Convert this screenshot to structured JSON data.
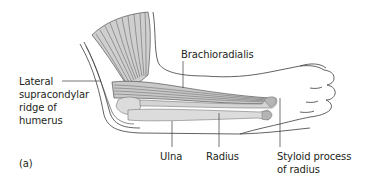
{
  "figure": {
    "panel_label": "(a)",
    "colors": {
      "outline": "#3a3a3a",
      "muscle_fill": "#c9c9c9",
      "muscle_fiber": "#555555",
      "bone_fill": "#dcdcdc",
      "bone_dark": "#b5b5b5",
      "leader_line": "#3a3a3a",
      "text": "#231f20",
      "background": "#ffffff"
    },
    "labels": {
      "lateral_supracondylar": "Lateral\nsupracondylar\nridge of\nhumerus",
      "brachioradialis": "Brachioradialis",
      "ulna": "Ulna",
      "radius": "Radius",
      "styloid_process": "Styloid process\nof radius"
    }
  }
}
